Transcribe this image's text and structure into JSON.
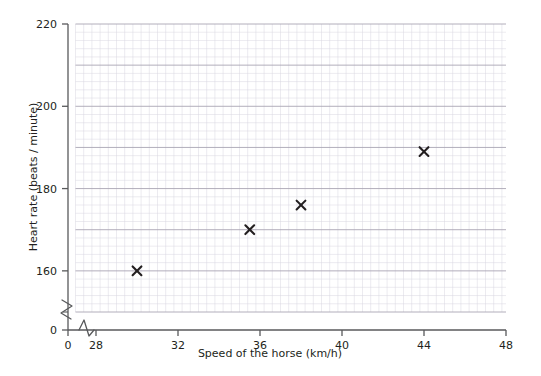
{
  "chart_data": {
    "type": "scatter",
    "title": "",
    "xlabel": "Speed of the horse (km/h)",
    "ylabel": "Heart rate (beats / minute)",
    "xlim": [
      27,
      48
    ],
    "ylim": [
      150,
      220
    ],
    "x_ticks": [
      "0",
      "28",
      "32",
      "36",
      "40",
      "44",
      "48"
    ],
    "y_ticks": [
      "0",
      "160",
      "180",
      "200",
      "220"
    ],
    "x_tick_values": [
      0,
      28,
      32,
      36,
      40,
      44,
      48
    ],
    "y_tick_values": [
      0,
      160,
      180,
      200,
      220
    ],
    "x_minor_step": 0.4,
    "y_minor_step": 2,
    "x_major_step": 2,
    "y_major_step": 10,
    "grid": true,
    "legend": "none",
    "axis_break_x": true,
    "axis_break_y": true,
    "marker": "x",
    "marker_color": "#231f20",
    "grid_minor_color": "#d9d6e0",
    "grid_major_color": "#a9a5b3",
    "axis_color": "#58595b",
    "points": [
      {
        "x": 30,
        "y": 160
      },
      {
        "x": 35.5,
        "y": 170
      },
      {
        "x": 38,
        "y": 176
      },
      {
        "x": 44,
        "y": 189
      }
    ],
    "point_labels": [
      "30, 160",
      "35.5, 170",
      "38, 176",
      "44, 189"
    ]
  }
}
